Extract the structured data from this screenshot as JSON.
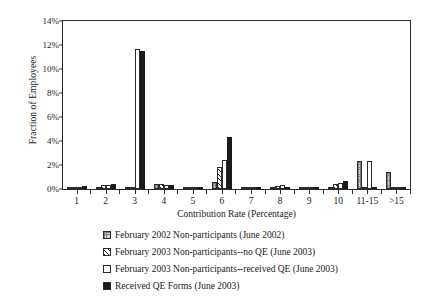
{
  "chart_data": {
    "type": "bar",
    "title": "",
    "xlabel": "Contribution Rate (Percentage)",
    "ylabel": "Fraction of Employees",
    "ylim": [
      0,
      14
    ],
    "yticks": [
      "0%",
      "2%",
      "4%",
      "6%",
      "8%",
      "10%",
      "12%",
      "14%"
    ],
    "ytick_values": [
      0,
      2,
      4,
      6,
      8,
      10,
      12,
      14
    ],
    "grid": false,
    "legend_position": "below",
    "categories": [
      "1",
      "2",
      "3",
      "4",
      "5",
      "6",
      "7",
      "8",
      "9",
      "10",
      "11-15",
      ">15"
    ],
    "series": [
      {
        "name": "February 2002 Non-participants (June 2002)",
        "pattern": "grid-stipple",
        "values": [
          0.2,
          0.2,
          0.15,
          0.45,
          0.1,
          0.6,
          0.15,
          0.2,
          0.2,
          0.2,
          2.3,
          1.4
        ]
      },
      {
        "name": "February 2003 Non-participants--no QE (June 2003)",
        "pattern": "diagonal-hatch",
        "values": [
          0.2,
          0.35,
          0.1,
          0.45,
          0.1,
          1.8,
          0.1,
          0.25,
          0.1,
          0.4,
          0.1,
          0.1
        ]
      },
      {
        "name": "February 2003 Non-participants--received QE (June 2003)",
        "pattern": "hollow-white",
        "values": [
          0.2,
          0.3,
          11.7,
          0.35,
          0.15,
          2.4,
          0.1,
          0.3,
          0.15,
          0.5,
          2.3,
          0.1
        ]
      },
      {
        "name": "Received QE Forms (June 2003)",
        "pattern": "solid-black",
        "values": [
          0.25,
          0.45,
          11.5,
          0.35,
          0.1,
          4.3,
          0.2,
          0.2,
          0.05,
          0.7,
          0.15,
          0.2
        ]
      }
    ]
  },
  "legend": {
    "items": [
      {
        "label": "February 2002 Non-participants (June 2002)",
        "swatch": "grid-stipple-swatch"
      },
      {
        "label": "February 2003 Non-participants--no QE (June 2003)",
        "swatch": "diagonal-hatch-swatch"
      },
      {
        "label": "February 2003 Non-participants--received QE (June 2003)",
        "swatch": "hollow-white-swatch"
      },
      {
        "label": "Received QE Forms (June 2003)",
        "swatch": "solid-black-swatch"
      }
    ]
  }
}
